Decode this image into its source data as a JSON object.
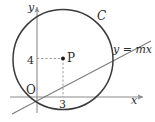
{
  "figure": {
    "kind": "geometry-diagram",
    "colors": {
      "background": "#ffffff",
      "curve": "#3a3a3a",
      "axis": "#8c8c8c",
      "dashed": "#9a9a9a",
      "text": "#2b2b2b",
      "point": "#1a1a1a"
    },
    "axes": {
      "x_label": "x",
      "y_label": "y",
      "origin_label": "O"
    },
    "labels": {
      "circle": "C",
      "line": "y = mx",
      "point": "P",
      "y_tick": "4",
      "x_tick": "3"
    },
    "geometry": {
      "circle": {
        "cx": 63,
        "cy": 59.5,
        "r": 50
      },
      "point_p": {
        "cx": 63,
        "cy": 58.5,
        "r": 1.8
      },
      "x_axis": {
        "x1": 10,
        "y1": 97,
        "x2": 145,
        "y2": 97
      },
      "y_axis": {
        "x1": 37,
        "y1": 112,
        "x2": 37,
        "y2": 5
      },
      "line_mx": {
        "x1": 13,
        "y1": 113,
        "x2": 150,
        "y2": 42
      },
      "dash_horizontal": {
        "x1": 37,
        "y1": 58.5,
        "x2": 63,
        "y2": 58.5
      },
      "dash_vertical": {
        "x1": 63,
        "y1": 58.5,
        "x2": 63,
        "y2": 97
      }
    }
  }
}
